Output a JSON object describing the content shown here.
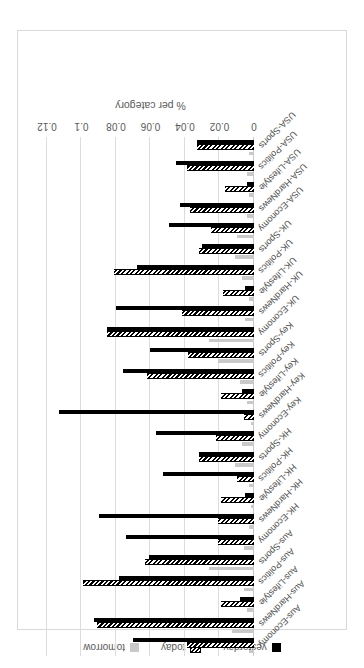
{
  "chart_data": {
    "type": "bar",
    "orientation": "horizontal",
    "title": "",
    "xlabel": "% per category",
    "ylabel": "",
    "xlim": [
      0,
      0.12
    ],
    "xticks": [
      "0",
      "0.02",
      "0.04",
      "0.06",
      "0.08",
      "0.1",
      "0.12"
    ],
    "xtick_values": [
      0,
      0.02,
      0.04,
      0.06,
      0.08,
      0.1,
      0.12
    ],
    "grid": true,
    "legend_position": "bottom",
    "categories": [
      "Aus-Economy",
      "Aus-HardNews",
      "Aus-Lifestyle",
      "Aus-Politics",
      "Aus-Sports",
      "HK-Economy",
      "HK-HardNews",
      "HK-Lifestyle",
      "HK-Politics",
      "HK-Sports",
      "Key-Economy",
      "Key-HardNews",
      "Key-Lifestyle",
      "Key-Politics",
      "Key-Sports",
      "UK-Economy",
      "UK-HardNews",
      "UK-Lifestyle",
      "UK-Politics",
      "UK-Sports",
      "USA-Economy",
      "USA-HardNews",
      "USA-Lifestyle",
      "USA-Politics",
      "USA-Sports"
    ],
    "series": [
      {
        "name": "yesterday",
        "color": "#000000",
        "values": [
          0.07,
          0.093,
          0.008,
          0.078,
          0.061,
          0.074,
          0.09,
          0.005,
          0.053,
          0.032,
          0.057,
          0.113,
          0.007,
          0.076,
          0.06,
          0.085,
          0.08,
          0.005,
          0.068,
          0.03,
          0.049,
          0.043,
          0.004,
          0.045,
          0.033
        ]
      },
      {
        "name": "today",
        "color": "#000000",
        "pattern": "hatched",
        "values": [
          0.039,
          0.091,
          0.019,
          0.099,
          0.063,
          0.021,
          0.021,
          0.019,
          0.01,
          0.032,
          0.022,
          0.006,
          0.019,
          0.062,
          0.038,
          0.085,
          0.042,
          0.018,
          0.081,
          0.032,
          0.025,
          0.037,
          0.017,
          0.039,
          0.033
        ]
      },
      {
        "name": "tomorrow",
        "color": "#c9c9c9",
        "values": [
          0.003,
          0.013,
          0.004,
          0.006,
          0.026,
          0.006,
          0.003,
          0.002,
          0.003,
          0.011,
          0.007,
          0.002,
          0.004,
          0.008,
          0.021,
          0.026,
          0.005,
          0.003,
          0.007,
          0.011,
          0.01,
          0.004,
          0.003,
          0.004,
          0.003
        ]
      }
    ]
  },
  "legend": {
    "items": [
      {
        "label": "yesterday",
        "swatch": "solid-black-square"
      },
      {
        "label": "today",
        "swatch": "hatched-square"
      },
      {
        "label": "tomorrow",
        "swatch": "solid-gray-square"
      }
    ]
  },
  "colors": {
    "yesterday": "#000000",
    "today": "#000000",
    "tomorrow": "#c9c9c9",
    "gridline": "#dcdcdc",
    "text": "#595959",
    "frame": "#d9d9d9"
  }
}
